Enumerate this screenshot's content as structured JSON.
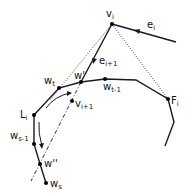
{
  "diagram": {
    "colors": {
      "stroke": "#1a1a1a",
      "background": "#ffffff"
    },
    "labels": {
      "v_i": "v",
      "v_i_sub": "i",
      "e_i": "e",
      "e_i_sub": "i",
      "e_i1": "e",
      "e_i1_sub": "i+1",
      "w_t": "w",
      "w_t_sub": "t",
      "w_prime": "w'",
      "w_t1": "w",
      "w_t1_sub": "t-1",
      "v_i1": "v",
      "v_i1_sub": "i+1",
      "L_i": "L",
      "L_i_sub": "i",
      "F_i": "F",
      "F_i_sub": "i",
      "w_s1": "w",
      "w_s1_sub": "s-1",
      "w_dprime": "w''",
      "w_s": "w",
      "w_s_sub": "s"
    },
    "points": {
      "v_i": [
        112,
        24
      ],
      "F_i": [
        168,
        99
      ],
      "L_i": [
        34,
        115
      ],
      "w_t": [
        59,
        88
      ],
      "w_prime": [
        81,
        82
      ],
      "w_t1": [
        105,
        79
      ],
      "v_i1": [
        72,
        101
      ],
      "w_s1": [
        34,
        144
      ],
      "w_dprime": [
        40,
        164
      ],
      "w_s": [
        46,
        183
      ]
    }
  }
}
